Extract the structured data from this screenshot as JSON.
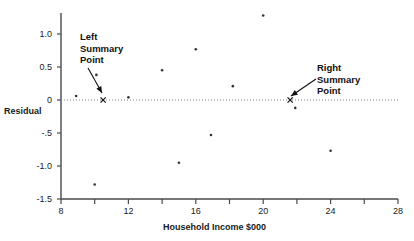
{
  "chart_data": {
    "type": "scatter",
    "title": "",
    "xlabel": "Household Income  $000",
    "ylabel": "Residual",
    "xlim": [
      8,
      28
    ],
    "ylim": [
      -1.5,
      1.25
    ],
    "grid": false,
    "legend": "none",
    "zero_reference_line": 0,
    "xticks": [
      {
        "value": 8,
        "label": "8"
      },
      {
        "value": 10,
        "label": ""
      },
      {
        "value": 12,
        "label": "12"
      },
      {
        "value": 14,
        "label": ""
      },
      {
        "value": 16,
        "label": "16"
      },
      {
        "value": 18,
        "label": ""
      },
      {
        "value": 20,
        "label": "20"
      },
      {
        "value": 22,
        "label": ""
      },
      {
        "value": 24,
        "label": "24"
      },
      {
        "value": 26,
        "label": ""
      },
      {
        "value": 28,
        "label": "28"
      }
    ],
    "yticks": [
      {
        "value": 1.0,
        "label": "1.0"
      },
      {
        "value": 0.5,
        "label": "0.5"
      },
      {
        "value": 0.0,
        "label": "0"
      },
      {
        "value": -0.5,
        "label": "-.5"
      },
      {
        "value": -1.0,
        "label": "-1.0"
      },
      {
        "value": -1.5,
        "label": "-1.5"
      }
    ],
    "series": [
      {
        "name": "Residuals",
        "marker": "dot",
        "color": "#333333",
        "points": [
          {
            "x": 8.9,
            "y": 0.06
          },
          {
            "x": 10.0,
            "y": -1.28
          },
          {
            "x": 10.1,
            "y": 0.38
          },
          {
            "x": 12.0,
            "y": 0.04
          },
          {
            "x": 14.0,
            "y": 0.45
          },
          {
            "x": 15.0,
            "y": -0.95
          },
          {
            "x": 16.0,
            "y": 0.77
          },
          {
            "x": 16.9,
            "y": -0.53
          },
          {
            "x": 18.2,
            "y": 0.21
          },
          {
            "x": 20.0,
            "y": 1.28
          },
          {
            "x": 21.9,
            "y": -0.12
          },
          {
            "x": 24.0,
            "y": -0.77
          }
        ]
      },
      {
        "name": "Summary Points",
        "marker": "x",
        "color": "#111111",
        "points": [
          {
            "x": 10.5,
            "y": 0.0,
            "label": "left-summary-point"
          },
          {
            "x": 21.6,
            "y": 0.0,
            "label": "right-summary-point"
          }
        ]
      }
    ],
    "annotations": [
      {
        "id": "left-summary-annotation",
        "lines": [
          "Left",
          "Summary",
          "Point"
        ],
        "text_x": 80,
        "text_y": 31,
        "arrow_from": [
          88,
          68
        ],
        "arrow_to": [
          102,
          93
        ]
      },
      {
        "id": "right-summary-annotation",
        "lines": [
          "Right",
          "Summary",
          "Point"
        ],
        "text_x": 317,
        "text_y": 62,
        "arrow_from": [
          316,
          79
        ],
        "arrow_to": [
          291,
          96
        ]
      }
    ],
    "colors": {
      "axis": "#4a4a4a",
      "point": "#333333",
      "text": "#111111",
      "reference_line": "#808080",
      "background": "#ffffff"
    }
  }
}
